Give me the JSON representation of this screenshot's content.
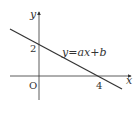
{
  "diagram": {
    "type": "coordinate-graph",
    "axes": {
      "x_label": "x",
      "y_label": "y",
      "origin_label": "O"
    },
    "ticks": {
      "y_intercept_label": "2",
      "x_intercept_label": "4"
    },
    "line": {
      "equation_label": "y=ax+b",
      "y_intercept": 2,
      "x_intercept": 4
    },
    "colors": {
      "stroke": "#333333",
      "background": "#ffffff"
    }
  }
}
